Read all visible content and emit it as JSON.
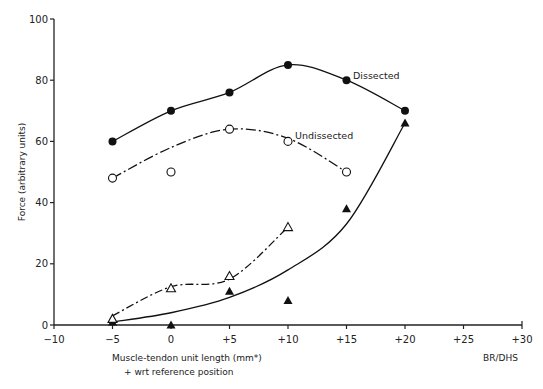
{
  "chart_data": {
    "type": "line",
    "title": "",
    "xlabel": "Muscle-tendon unit length (mm*)",
    "xlabel_note": "* wrt reference position",
    "ylabel": "Force (arbitrary units)",
    "credit": "BR/DHS",
    "xlim": [
      -10,
      30
    ],
    "ylim": [
      0,
      100
    ],
    "xticks": [
      -10,
      -5,
      0,
      5,
      10,
      15,
      20,
      25,
      30
    ],
    "xtick_labels": [
      "−10",
      "−5",
      "0",
      "+5",
      "+10",
      "+15",
      "+20",
      "+25",
      "+30"
    ],
    "yticks": [
      0,
      20,
      40,
      60,
      80,
      100
    ],
    "ytick_labels": [
      "0",
      "20",
      "40",
      "60",
      "80",
      "100"
    ],
    "grid": false,
    "series": [
      {
        "name": "Dissected",
        "marker": "filled-circle",
        "line": "solid",
        "labeled": true,
        "x": [
          -5,
          0,
          5,
          10,
          15,
          20
        ],
        "y": [
          60,
          70,
          76,
          85,
          80,
          70
        ]
      },
      {
        "name": "Undissected",
        "marker": "open-circle",
        "line": "dash-dot",
        "labeled": true,
        "x": [
          -5,
          0,
          5,
          10,
          15
        ],
        "y": [
          48,
          50,
          64,
          60,
          50
        ]
      },
      {
        "name": "Dissected (passive)",
        "marker": "filled-triangle",
        "line": "solid",
        "labeled": false,
        "x": [
          -5,
          0,
          5,
          10,
          15,
          20
        ],
        "y": [
          1,
          0,
          11,
          8,
          38,
          66
        ]
      },
      {
        "name": "Undissected (passive)",
        "marker": "open-triangle",
        "line": "dash-dot",
        "labeled": false,
        "x": [
          -5,
          0,
          5,
          10
        ],
        "y": [
          2,
          12,
          16,
          32
        ]
      }
    ]
  },
  "labels": {
    "dissected": "Dissected",
    "undissected": "Undissected",
    "xlabel": "Muscle-tendon unit length (mm*)",
    "xlabel_note": "+ wrt reference position",
    "ylabel": "Force (arbitrary units)",
    "credit": "BR/DHS"
  }
}
